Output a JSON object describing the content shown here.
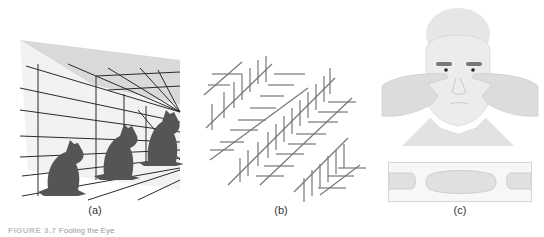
{
  "figure": {
    "panels": [
      {
        "id": "a",
        "label": "(a)",
        "description": "Perspective corridor grid with three cat silhouettes of identical size"
      },
      {
        "id": "b",
        "label": "(b)",
        "description": "Zöllner-style illusion: parallel diagonal lines crossed by short hatch marks"
      },
      {
        "id": "c",
        "label": "(c)",
        "description": "Man pressing fingertips together in front of eyes; inset showing floating finger 'sausage'"
      }
    ],
    "caption": {
      "number": "FIGURE 3.7",
      "text": "Fooling the Eye"
    }
  },
  "colors": {
    "cat": "#555555",
    "grid_line": "#2a2a2a",
    "wall_shade": "#d8d8d8",
    "hatch": "#777777",
    "skin": "#e2e2e2",
    "collar": "#9a9a9a"
  }
}
